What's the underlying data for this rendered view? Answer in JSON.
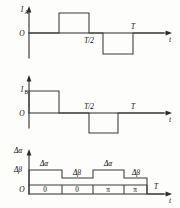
{
  "figure": {
    "background_color": "#fdfdfc",
    "line_color": "#3a3a3a",
    "axis_color": "#2b2b2b"
  },
  "charts": [
    {
      "id": "chart-ia",
      "type": "line",
      "y_axis_label": "I",
      "y_axis_subscript": "A",
      "x_axis_label": "t",
      "origin_label": "O",
      "tick_labels": [
        "T/2",
        "T"
      ],
      "series_name": "I_A",
      "description": "Bipolar square wave: zero, positive pulse, zero, negative pulse",
      "x": [
        0,
        0.22,
        0.22,
        0.52,
        0.52,
        0.62,
        0.62,
        0.92,
        0.92,
        1.0
      ],
      "y": [
        0,
        0,
        1,
        1,
        0,
        0,
        -1,
        -1,
        0,
        0
      ],
      "ylim": [
        -1.3,
        1.3
      ],
      "grid": false
    },
    {
      "id": "chart-ib",
      "type": "line",
      "y_axis_label": "I",
      "y_axis_subscript": "B",
      "x_axis_label": "t",
      "origin_label": "O",
      "tick_labels": [
        "T/2",
        "T"
      ],
      "series_name": "I_B",
      "description": "Positive pulse from origin, then negative pulse after T/2",
      "x": [
        0,
        0,
        0.22,
        0.22,
        0.52,
        0.52,
        0.72,
        0.72,
        1.0
      ],
      "y": [
        0,
        1,
        1,
        0,
        0,
        -1,
        -1,
        0,
        0
      ],
      "ylim": [
        -1.3,
        1.3
      ],
      "grid": false
    },
    {
      "id": "chart-delta",
      "type": "bar",
      "y_axis_label_upper": "Δα",
      "y_axis_label_lower": "Δβ",
      "x_axis_label": "t",
      "origin_label": "O",
      "tick_labels": [
        "T"
      ],
      "description": "Four phase blocks with alternating heights",
      "block_labels": [
        "0",
        "0",
        "π",
        "π"
      ],
      "block_heights": [
        1.0,
        0.62,
        1.0,
        0.62
      ],
      "block_top_labels": [
        "Δα",
        "Δβ",
        "Δα",
        "Δβ"
      ],
      "ylim": [
        0,
        1.3
      ],
      "grid": false
    }
  ]
}
